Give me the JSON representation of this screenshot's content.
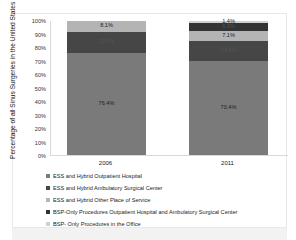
{
  "chart_data": {
    "type": "bar",
    "stacked": true,
    "title": "",
    "xlabel": "",
    "ylabel": "Percentage of all Sinus Surgeries in the United States",
    "ylim": [
      0,
      100
    ],
    "yticks": [
      "0%",
      "10%",
      "20%",
      "30%",
      "40%",
      "50%",
      "60%",
      "70%",
      "80%",
      "90%",
      "100%"
    ],
    "categories": [
      "2006",
      "2011"
    ],
    "series": [
      {
        "name": "ESS and Hybrid Outpatient Hospital",
        "color": "#7a7a7a",
        "values": [
          76.4,
          70.4
        ],
        "labels": [
          "76.4%",
          "70.4%"
        ]
      },
      {
        "name": "ESS and Hybrid Ambulatory Surgical Center",
        "color": "#464646",
        "values": [
          15.5,
          14.8
        ],
        "labels": [
          "15.5%",
          "14.8%"
        ]
      },
      {
        "name": "ESS and Hybrid Other Place of Service",
        "color": "#b4b4b4",
        "values": [
          8.1,
          7.1
        ],
        "labels": [
          "8.1%",
          "7.1%"
        ]
      },
      {
        "name": "BSP-Only Procedures Outpatient Hospital and Ambulatory Surgical Center",
        "color": "#333333",
        "values": [
          0,
          6.3
        ],
        "labels": [
          "",
          "6.3%"
        ]
      },
      {
        "name": "BSP- Only Procedures in the Office",
        "color": "#d0d0d0",
        "values": [
          0,
          1.4
        ],
        "labels": [
          "",
          "1.4%"
        ]
      }
    ],
    "legend_position": "bottom-left",
    "grid": false
  }
}
